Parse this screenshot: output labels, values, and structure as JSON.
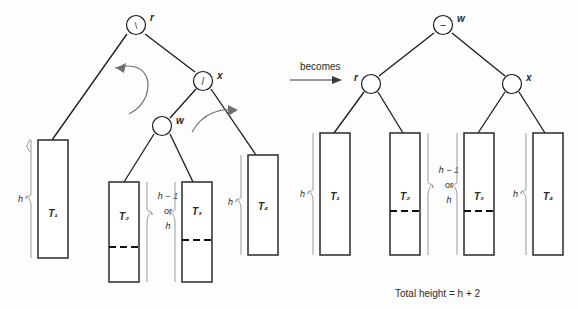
{
  "figure": {
    "type": "avl-double-rotation-diagram",
    "transition_label": "becomes",
    "total_height_label": "Total height = h + 2",
    "colors": {
      "background": "#fdfdfd",
      "stroke": "#1a1a1a",
      "box_stroke": "#2a2a2a",
      "brace": "#9a9a9a",
      "arrow": "#6e6e6e",
      "text": "#2b2b2b"
    }
  },
  "left_tree": {
    "nodes": [
      {
        "id": "r",
        "label": "r",
        "marker": "\\",
        "cx": 136,
        "cy": 25,
        "label_side": "right"
      },
      {
        "id": "x",
        "label": "x",
        "marker": "/",
        "cx": 203,
        "cy": 81,
        "label_side": "right"
      },
      {
        "id": "w",
        "label": "w",
        "marker": "",
        "cx": 162,
        "cy": 126,
        "label_side": "right"
      }
    ],
    "subtrees": [
      {
        "id": "T1",
        "label": "T₁",
        "height_label": "h",
        "has_dash": false
      },
      {
        "id": "T2",
        "label": "T₂",
        "height_label": "h − 1 or h",
        "has_dash": true
      },
      {
        "id": "T3",
        "label": "T₃",
        "height_label": "h − 1 or h",
        "has_dash": true
      },
      {
        "id": "T4",
        "label": "T₄",
        "height_label": "h",
        "has_dash": false
      }
    ],
    "height_labels": {
      "t1": "h",
      "middle_line1": "h − 1",
      "middle_line2": "or",
      "middle_line3": "h",
      "t4": "h"
    },
    "rotation_arrows": [
      {
        "id": "arrow-left-ccw",
        "direction": "counter-clockwise"
      },
      {
        "id": "arrow-right-cw",
        "direction": "clockwise"
      }
    ]
  },
  "right_tree": {
    "nodes": [
      {
        "id": "w",
        "label": "w",
        "marker": "−",
        "cx": 443,
        "cy": 25,
        "label_side": "right"
      },
      {
        "id": "r",
        "label": "r",
        "marker": "",
        "cx": 371,
        "cy": 84,
        "label_side": "left"
      },
      {
        "id": "x",
        "label": "x",
        "marker": "",
        "cx": 512,
        "cy": 84,
        "label_side": "right"
      }
    ],
    "subtrees": [
      {
        "id": "T1",
        "label": "T₁",
        "height_label": "h",
        "has_dash": false
      },
      {
        "id": "T2",
        "label": "T₂",
        "height_label": "h − 1 or h",
        "has_dash": true
      },
      {
        "id": "T3",
        "label": "T₃",
        "height_label": "h − 1 or h",
        "has_dash": true
      },
      {
        "id": "T4",
        "label": "T₄",
        "height_label": "h",
        "has_dash": false
      }
    ],
    "height_labels": {
      "t1": "h",
      "middle_line1": "h − 1",
      "middle_line2": "or",
      "middle_line3": "h",
      "t4": "h"
    }
  }
}
